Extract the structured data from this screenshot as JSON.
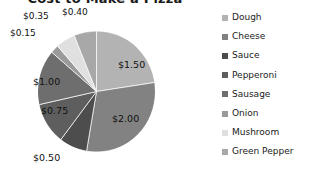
{
  "chart_data": {
    "type": "pie",
    "title": "Cost to Make a Pizza",
    "categories": [
      "Dough",
      "Cheese",
      "Sauce",
      "Pepperoni",
      "Sausage",
      "Onion",
      "Mushroom",
      "Green Pepper"
    ],
    "values": [
      1.5,
      2.0,
      0.5,
      0.75,
      1.0,
      0.15,
      0.35,
      0.4
    ],
    "value_labels": [
      "$1.50",
      "$2.00",
      "$0.50",
      "$0.75",
      "$1.00",
      "$0.15",
      "$0.35",
      "$0.40"
    ],
    "colors": [
      "#b3b3b3",
      "#828282",
      "#4d4d4d",
      "#5e5e5e",
      "#6e6e6e",
      "#9a9a9a",
      "#e0e0e0",
      "#a8a8a8"
    ],
    "total": 6.65,
    "xlabel": "",
    "ylabel": "",
    "grid": false,
    "legend_position": "right",
    "start_angle_deg": 0,
    "direction": "clockwise"
  },
  "labels": {
    "dough": "$1.50",
    "cheese": "$2.00",
    "sauce": "$0.50",
    "pepperoni": "$0.75",
    "sausage": "$1.00",
    "onion": "$0.15",
    "mushroom": "$0.35",
    "green_pepper": "$0.40"
  },
  "legend": {
    "items": [
      {
        "label": "Dough",
        "color": "#b3b3b3"
      },
      {
        "label": "Cheese",
        "color": "#828282"
      },
      {
        "label": "Sauce",
        "color": "#4d4d4d"
      },
      {
        "label": "Pepperoni",
        "color": "#5e5e5e"
      },
      {
        "label": "Sausage",
        "color": "#6e6e6e"
      },
      {
        "label": "Onion",
        "color": "#9a9a9a"
      },
      {
        "label": "Mushroom",
        "color": "#e0e0e0"
      },
      {
        "label": "Green Pepper",
        "color": "#a8a8a8"
      }
    ]
  },
  "title": "Cost to Make a Pizza"
}
